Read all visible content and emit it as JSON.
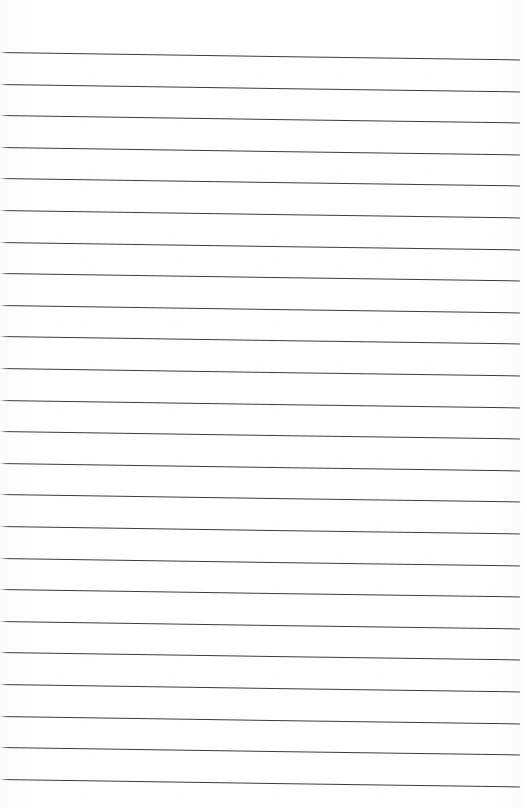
{
  "document": {
    "kind": "scanned-lined-paper",
    "title": "Blank ruled notebook page",
    "page_width": 527,
    "page_height": 808,
    "background_color": "#ffffff",
    "has_handwriting": false,
    "has_text": false,
    "visible_text": "",
    "ruling": {
      "line_color": "#3c3c40",
      "line_thickness_px": 1.3,
      "line_count": 23,
      "line_spacing_px": 31.6,
      "line_start_x": 0,
      "line_end_x": 520,
      "first_line_left_y": 52,
      "skew_drop_px": 7.5,
      "top_margin_px": 50,
      "right_margin_px": 7,
      "orientation": "horizontal-ruled",
      "has_vertical_margin_rule": false
    },
    "lines": [
      {
        "index": 1,
        "left_y": 52.0,
        "right_y": 59.5
      },
      {
        "index": 2,
        "left_y": 83.6,
        "right_y": 91.1
      },
      {
        "index": 3,
        "left_y": 115.2,
        "right_y": 122.7
      },
      {
        "index": 4,
        "left_y": 146.8,
        "right_y": 154.3
      },
      {
        "index": 5,
        "left_y": 178.4,
        "right_y": 185.9
      },
      {
        "index": 6,
        "left_y": 210.0,
        "right_y": 217.5
      },
      {
        "index": 7,
        "left_y": 241.6,
        "right_y": 249.1
      },
      {
        "index": 8,
        "left_y": 273.2,
        "right_y": 280.7
      },
      {
        "index": 9,
        "left_y": 304.8,
        "right_y": 312.3
      },
      {
        "index": 10,
        "left_y": 336.4,
        "right_y": 343.9
      },
      {
        "index": 11,
        "left_y": 368.0,
        "right_y": 375.5
      },
      {
        "index": 12,
        "left_y": 399.6,
        "right_y": 407.1
      },
      {
        "index": 13,
        "left_y": 431.2,
        "right_y": 438.7
      },
      {
        "index": 14,
        "left_y": 462.8,
        "right_y": 470.3
      },
      {
        "index": 15,
        "left_y": 494.4,
        "right_y": 501.9
      },
      {
        "index": 16,
        "left_y": 526.0,
        "right_y": 533.5
      },
      {
        "index": 17,
        "left_y": 557.6,
        "right_y": 565.1
      },
      {
        "index": 18,
        "left_y": 589.2,
        "right_y": 596.7
      },
      {
        "index": 19,
        "left_y": 620.8,
        "right_y": 628.3
      },
      {
        "index": 20,
        "left_y": 652.4,
        "right_y": 659.9
      },
      {
        "index": 21,
        "left_y": 684.0,
        "right_y": 691.5
      },
      {
        "index": 22,
        "left_y": 715.6,
        "right_y": 723.1
      },
      {
        "index": 23,
        "left_y": 747.2,
        "right_y": 754.7
      },
      {
        "index": 24,
        "left_y": 778.8,
        "right_y": 786.3
      }
    ]
  }
}
